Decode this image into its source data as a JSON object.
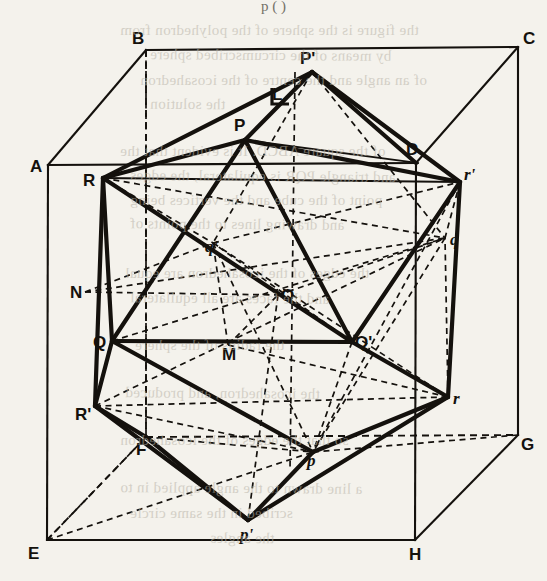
{
  "page": {
    "header_text": "p (  )",
    "background": "#f4f2ec",
    "ink": "#14110d",
    "width": 547,
    "height": 581
  },
  "figure": {
    "name": "icosahedron-inscribed-in-cube",
    "cube_vertices": [
      {
        "id": "A",
        "x": 48,
        "y": 165,
        "style": "upright"
      },
      {
        "id": "B",
        "x": 146,
        "y": 50,
        "style": "upright"
      },
      {
        "id": "C",
        "x": 518,
        "y": 47,
        "style": "upright"
      },
      {
        "id": "D",
        "x": 416,
        "y": 163,
        "style": "upright"
      },
      {
        "id": "E",
        "x": 47,
        "y": 540,
        "style": "upright"
      },
      {
        "id": "F",
        "x": 146,
        "y": 437,
        "style": "upright"
      },
      {
        "id": "G",
        "x": 518,
        "y": 435,
        "style": "upright"
      },
      {
        "id": "H",
        "x": 415,
        "y": 540,
        "style": "upright"
      }
    ],
    "icosa_vertices": [
      {
        "id": "P",
        "x": 245,
        "y": 140,
        "style": "upright"
      },
      {
        "id": "P'",
        "x": 312,
        "y": 72,
        "style": "upright"
      },
      {
        "id": "Q",
        "x": 112,
        "y": 341,
        "style": "upright"
      },
      {
        "id": "Q'",
        "x": 352,
        "y": 342,
        "style": "upright"
      },
      {
        "id": "R",
        "x": 103,
        "y": 178,
        "style": "upright"
      },
      {
        "id": "R'",
        "x": 95,
        "y": 406,
        "style": "upright"
      },
      {
        "id": "p",
        "x": 313,
        "y": 452,
        "style": "italic"
      },
      {
        "id": "p'",
        "x": 248,
        "y": 520,
        "style": "italic"
      },
      {
        "id": "q",
        "x": 445,
        "y": 238,
        "style": "italic"
      },
      {
        "id": "q'",
        "x": 213,
        "y": 243,
        "style": "italic"
      },
      {
        "id": "r",
        "x": 448,
        "y": 397,
        "style": "italic"
      },
      {
        "id": "r'",
        "x": 460,
        "y": 182,
        "style": "italic"
      }
    ],
    "aux_points": [
      {
        "id": "L",
        "x": 277,
        "y": 96,
        "style": "upright"
      },
      {
        "id": "M",
        "x": 228,
        "y": 345,
        "style": "upright"
      },
      {
        "id": "N",
        "x": 85,
        "y": 292,
        "style": "upright"
      },
      {
        "id": "O",
        "x": 278,
        "y": 295,
        "style": "upright"
      }
    ],
    "labels": [
      {
        "id": "A",
        "text": "A",
        "x": 30,
        "y": 172,
        "style": "upright"
      },
      {
        "id": "B",
        "text": "B",
        "x": 132,
        "y": 44,
        "style": "upright"
      },
      {
        "id": "C",
        "text": "C",
        "x": 523,
        "y": 44,
        "style": "upright"
      },
      {
        "id": "D",
        "text": "D",
        "x": 406,
        "y": 155,
        "style": "upright"
      },
      {
        "id": "E",
        "text": "E",
        "x": 28,
        "y": 559,
        "style": "upright"
      },
      {
        "id": "F",
        "text": "F",
        "x": 136,
        "y": 455,
        "style": "upright"
      },
      {
        "id": "G",
        "text": "G",
        "x": 521,
        "y": 450,
        "style": "upright"
      },
      {
        "id": "H",
        "text": "H",
        "x": 409,
        "y": 560,
        "style": "upright"
      },
      {
        "id": "L",
        "text": "L",
        "x": 272,
        "y": 100,
        "style": "upright"
      },
      {
        "id": "M",
        "text": "M",
        "x": 222,
        "y": 360,
        "style": "upright"
      },
      {
        "id": "N",
        "text": "N",
        "x": 70,
        "y": 298,
        "style": "upright"
      },
      {
        "id": "O",
        "text": "O",
        "x": 281,
        "y": 301,
        "style": "upright"
      },
      {
        "id": "P",
        "text": "P",
        "x": 234,
        "y": 131,
        "style": "upright"
      },
      {
        "id": "Pp",
        "text": "P'",
        "x": 300,
        "y": 64,
        "style": "upright"
      },
      {
        "id": "Q",
        "text": "Q",
        "x": 93,
        "y": 348,
        "style": "upright"
      },
      {
        "id": "Qp",
        "text": "Q'",
        "x": 355,
        "y": 348,
        "style": "upright"
      },
      {
        "id": "R",
        "text": "R",
        "x": 83,
        "y": 186,
        "style": "upright"
      },
      {
        "id": "Rp",
        "text": "R'",
        "x": 75,
        "y": 420,
        "style": "upright"
      },
      {
        "id": "p",
        "text": "p",
        "x": 307,
        "y": 466,
        "style": "italic"
      },
      {
        "id": "pp",
        "text": "p'",
        "x": 240,
        "y": 540,
        "style": "italic"
      },
      {
        "id": "q",
        "text": "q",
        "x": 450,
        "y": 245,
        "style": "italic"
      },
      {
        "id": "qp",
        "text": "q'",
        "x": 205,
        "y": 252,
        "style": "italic"
      },
      {
        "id": "r",
        "text": "r",
        "x": 453,
        "y": 404,
        "style": "italic"
      },
      {
        "id": "rp",
        "text": "r'",
        "x": 464,
        "y": 180,
        "style": "italic"
      }
    ]
  },
  "bleed_text": [
    {
      "text": "the figure is the sphere of the polyhedron from",
      "x": 120,
      "y": 22
    },
    {
      "text": "by means of the circumscribed sphere",
      "x": 150,
      "y": 47
    },
    {
      "text": "of an angle and the centre of the icosahedron",
      "x": 140,
      "y": 72
    },
    {
      "text": "the solution",
      "x": 150,
      "y": 96
    },
    {
      "text": "of the square ABCD. It is evident that the",
      "x": 120,
      "y": 143
    },
    {
      "text": "and triangle PQR is equilateral, the edges",
      "x": 130,
      "y": 168
    },
    {
      "text": "point of the cube and the vertices being",
      "x": 130,
      "y": 192
    },
    {
      "text": "and drawing lines to the points of",
      "x": 130,
      "y": 216
    },
    {
      "text": "the edges of the icosahedron are equal",
      "x": 125,
      "y": 265
    },
    {
      "text": "and the faces are all equilateral",
      "x": 130,
      "y": 290
    },
    {
      "text": "the radius of the sphere",
      "x": 135,
      "y": 337
    },
    {
      "text": "the icosahedron, and produced",
      "x": 125,
      "y": 385
    },
    {
      "text": "so that the edges of the icosahedron",
      "x": 120,
      "y": 432
    },
    {
      "text": "a line drawn to the angle applied in to",
      "x": 120,
      "y": 480
    },
    {
      "text": "scribed in the same circle",
      "x": 130,
      "y": 505
    },
    {
      "text": "the angles",
      "x": 210,
      "y": 530
    }
  ]
}
